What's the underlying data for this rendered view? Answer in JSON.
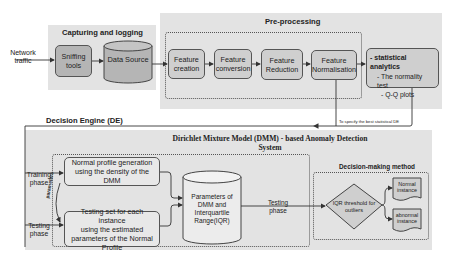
{
  "input": {
    "label_line1": "Network",
    "label_line2": "traffic"
  },
  "capturing": {
    "title": "Capturing and logging",
    "sniffing": {
      "line1": "Sniffing",
      "line2": "tools"
    },
    "data_source": "Data Source"
  },
  "preprocessing": {
    "title": "Pre-processing",
    "steps": [
      {
        "line1": "Feature",
        "line2": "creation"
      },
      {
        "line1": "Feature",
        "line2": "conversion"
      },
      {
        "line1": "Feature",
        "line2": "Reduction"
      },
      {
        "line1": "Feature",
        "line2": "Normalisation"
      }
    ],
    "stats": {
      "heading": "- statistical analytics",
      "item1": "- The normality test",
      "item2": "- Q-Q plots"
    },
    "feedback_label": "To specify the best statistical DE"
  },
  "decision_engine": {
    "title": "Decision Engine (DE)",
    "dmm_title_line1": "Dirichlet Mixture Model (DMM) - based Anomaly Detection",
    "dmm_title_line2": "System",
    "training_label": {
      "line1": "Training",
      "line2": "phase"
    },
    "testing_label": {
      "line1": "Testing",
      "line2": "phase"
    },
    "parameters_label": "parameters",
    "normal_profile": {
      "line1": "Normal profile generation",
      "line2": "using the density of the DMM"
    },
    "testing_set": {
      "line1": "Testing set for each instance",
      "line2": "using the estimated",
      "line3": "parameters of the Normal",
      "line4": "Profile"
    },
    "params_store": {
      "line1": "Parameters of",
      "line2": "DMM and",
      "line3": "Interquartile",
      "line4": "Range(IQR)"
    },
    "testing_phase_arrow": {
      "line1": "Testing",
      "line2": "phase"
    },
    "decision_method": {
      "title": "Decision-making method",
      "diamond": {
        "line1": "IQR threshold for",
        "line2": "outliers"
      },
      "normal": {
        "line1": "Normal",
        "line2": "instance"
      },
      "abnormal": {
        "line1": "abnormal",
        "line2": "instance"
      }
    }
  }
}
